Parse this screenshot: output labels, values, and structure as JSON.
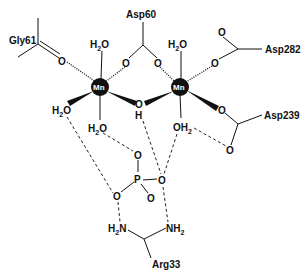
{
  "diagram": {
    "type": "chemical-structure",
    "colors": {
      "ink": "#111111",
      "background": "#ffffff",
      "metal_fill": "#111111",
      "metal_text": "#ffffff"
    },
    "metals": [
      {
        "id": "mn1",
        "label": "Mn",
        "x": 100,
        "y": 87
      },
      {
        "id": "mn2",
        "label": "Mn",
        "x": 180,
        "y": 87
      }
    ],
    "residues": {
      "gly61": "Gly61",
      "asp60": "Asp60",
      "asp282": "Asp282",
      "asp239": "Asp239",
      "arg33": "Arg33"
    },
    "atoms": {
      "gly61_o": "O",
      "asp60_o1": "O",
      "asp60_o2": "O",
      "asp282_o_top": "O",
      "asp282_o": "O",
      "asp239_o1": "O",
      "asp239_o2": "O",
      "bridge_o": "O",
      "bridge_h": "H",
      "mn1_water_top": "H2O",
      "mn2_water_top": "H2O",
      "mn1_water_left": "H2O",
      "mn1_water_bottom": "H2O",
      "mn2_water_bottom": "OH2",
      "p": "P",
      "po_top": "O",
      "po_left": "O",
      "po_right": "O",
      "po_bottom": "O",
      "arg_n1": "H2N",
      "arg_n2": "NH2"
    },
    "bond_types": [
      "solid",
      "wedge",
      "hashed",
      "hydrogen-bond-dashed"
    ]
  }
}
